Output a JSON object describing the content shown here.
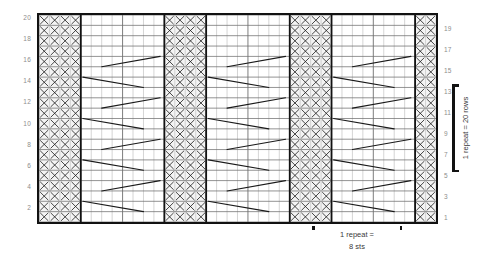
{
  "chart_data": {
    "type": "table",
    "title": "",
    "xlabel": "",
    "ylabel": "",
    "cols": 38,
    "rows": 20,
    "symbol": "X",
    "grid": true,
    "legend_position": "none",
    "row_labels_left": [
      "20",
      "18",
      "16",
      "14",
      "12",
      "10",
      "8",
      "6",
      "4",
      "2"
    ],
    "row_labels_right": [
      "19",
      "17",
      "15",
      "13",
      "11",
      "9",
      "7",
      "5",
      "3",
      "1"
    ],
    "purl_columns": [
      0,
      1,
      2,
      3,
      12,
      13,
      14,
      15,
      24,
      25,
      26,
      27,
      36,
      37
    ],
    "annotations": {
      "repeat_rows_line1": "1 repeat =",
      "repeat_rows_line2": "20 rows",
      "repeat_sts_line1": "1 repeat =",
      "repeat_sts_line2": "8 sts"
    },
    "zigzag_rows": [
      2,
      3,
      6,
      7,
      10,
      11,
      14,
      15,
      18,
      19
    ]
  },
  "colors": {
    "frame": "#121212",
    "grid_line": "#6f6f6f",
    "grid_line_light": "#b9b9b9",
    "symbol": "#1a1a1a",
    "row_number": "#8d8d8d",
    "annotation": "#3a3a3a",
    "background": "#ffffff"
  }
}
